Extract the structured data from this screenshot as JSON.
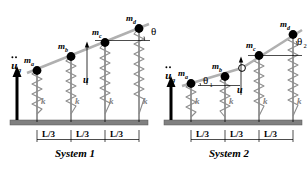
{
  "figure": {
    "background": "#ffffff",
    "colors": {
      "mass": "#000000",
      "bar": "#9a9a9a",
      "spring": "#8c8c8c",
      "ground": "#808080",
      "hinge_fill": "#ffffff",
      "text": "#000000",
      "k_label": "#808080"
    }
  },
  "systems": [
    {
      "id": "system-1",
      "caption": "System 1",
      "masses": [
        {
          "id": "ma",
          "base": "m",
          "sub": "a"
        },
        {
          "id": "mb",
          "base": "m",
          "sub": "b"
        },
        {
          "id": "mc",
          "base": "m",
          "sub": "c"
        },
        {
          "id": "md",
          "base": "m",
          "sub": "d"
        }
      ],
      "springs": [
        {
          "id": "k1",
          "label": "k"
        },
        {
          "id": "k2",
          "label": "k"
        },
        {
          "id": "k3",
          "label": "k"
        },
        {
          "id": "k4",
          "label": "k"
        }
      ],
      "angles": [
        {
          "id": "theta",
          "glyph": "θ",
          "sub": ""
        }
      ],
      "displacement": {
        "label": "u"
      },
      "ground_excitation": {
        "base": "u",
        "sub": "g",
        "accent": "double-dot"
      },
      "dimensions": [
        {
          "label": "L/3"
        },
        {
          "label": "L/3"
        },
        {
          "label": "L/3"
        }
      ]
    },
    {
      "id": "system-2",
      "caption": "System 2",
      "masses": [
        {
          "id": "ma",
          "base": "m",
          "sub": "a"
        },
        {
          "id": "mb",
          "base": "m",
          "sub": "b"
        },
        {
          "id": "mc",
          "base": "m",
          "sub": "c"
        },
        {
          "id": "md",
          "base": "m",
          "sub": "d"
        }
      ],
      "springs": [
        {
          "id": "k1",
          "label": "k"
        },
        {
          "id": "k2",
          "label": "k"
        },
        {
          "id": "k3",
          "label": "k"
        },
        {
          "id": "k4",
          "label": "k"
        }
      ],
      "angles": [
        {
          "id": "theta1",
          "glyph": "θ",
          "sub": "1"
        },
        {
          "id": "theta2",
          "glyph": "θ",
          "sub": "2"
        }
      ],
      "displacement": {
        "label": "u"
      },
      "ground_excitation": {
        "base": "u",
        "sub": "g",
        "accent": "double-dot"
      },
      "dimensions": [
        {
          "label": "L/3"
        },
        {
          "label": "L/3"
        },
        {
          "label": "L/3"
        }
      ],
      "hinge": {
        "id": "mid-hinge",
        "style": "open-circle"
      }
    }
  ]
}
